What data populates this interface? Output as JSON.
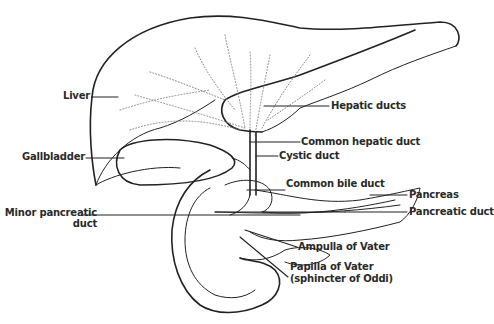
{
  "figure": {
    "labels": {
      "liver": "Liver",
      "gallbladder": "Gallbladder",
      "minor_pancreatic_duct_line1": "Minor pancreatic",
      "minor_pancreatic_duct_line2": "duct",
      "hepatic_ducts": "Hepatic ducts",
      "common_hepatic_duct": "Common hepatic duct",
      "cystic_duct": "Cystic duct",
      "common_bile_duct": "Common bile duct",
      "pancreas": "Pancreas",
      "pancreatic_duct": "Pancreatic duct",
      "ampulla_of_vater": "Ampulla of Vater",
      "papilla_of_vater_line1": "Papilla of Vater",
      "papilla_of_vater_line2": "(sphincter of Oddi)"
    },
    "colors": {
      "ink": "#222222",
      "background": "#ffffff"
    }
  }
}
